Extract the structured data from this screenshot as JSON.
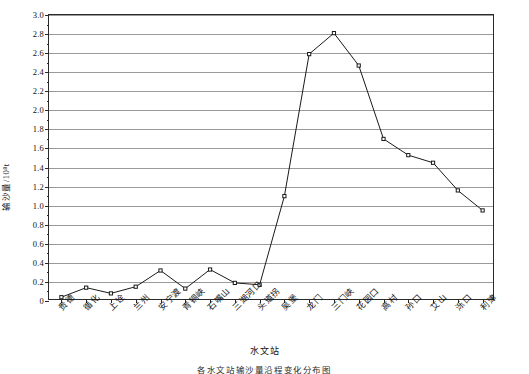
{
  "chart_data": {
    "type": "line",
    "title": "",
    "xlabel": "水文站",
    "ylabel": "输沙量/10⁸t",
    "ylim": [
      0,
      3.0
    ],
    "ytick_step": 0.2,
    "grid": true,
    "legend": "none",
    "marker": "open-square",
    "line_color": "#1a1a1a",
    "grid_color": "#9a9a9a",
    "axis_color": "#2a2a2a",
    "categories": [
      "贵德",
      "循化",
      "上诠",
      "兰州",
      "安宁渡",
      "青铜峡",
      "石嘴山",
      "三湖河口",
      "头道拐",
      "吴堡",
      "龙门",
      "三门峡",
      "花园口",
      "高村",
      "孙口",
      "艾山",
      "泺口",
      "利津"
    ],
    "values": [
      0.04,
      0.14,
      0.08,
      0.15,
      0.32,
      0.13,
      0.33,
      0.19,
      0.17,
      1.1,
      2.59,
      2.81,
      2.47,
      1.7,
      1.53,
      1.45,
      1.16,
      0.95
    ],
    "yticks": [
      "0",
      "0.2",
      "0.4",
      "0.6",
      "0.8",
      "1.0",
      "1.2",
      "1.4",
      "1.6",
      "1.8",
      "2.0",
      "2.2",
      "2.4",
      "2.6",
      "2.8",
      "3.0"
    ]
  },
  "caption": {
    "text": "各水文站输沙量沿程变化分布图"
  }
}
